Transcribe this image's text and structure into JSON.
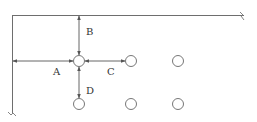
{
  "diagram": {
    "title": "",
    "labels": {
      "A": "A",
      "B": "B",
      "C": "C",
      "D": "D"
    },
    "colors": {
      "line": "#6e6e6e",
      "circle": "#777777",
      "text": "#333333"
    },
    "break_marks": [
      "top-right",
      "bottom-left"
    ],
    "grid": {
      "rows": 2,
      "cols": 3,
      "reference_node": "row 1, col 1"
    }
  }
}
